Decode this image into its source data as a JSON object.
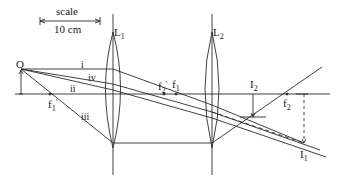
{
  "diagram": {
    "scale": {
      "label": "scale",
      "value": "10 cm"
    },
    "object": {
      "label": "O"
    },
    "lenses": [
      {
        "label": "L",
        "sub": "1"
      },
      {
        "label": "L",
        "sub": "2"
      }
    ],
    "rays": [
      {
        "label": "i"
      },
      {
        "label": "ii"
      },
      {
        "label": "iii"
      },
      {
        "label": "iv"
      }
    ],
    "focal_points": [
      {
        "label": "f",
        "sub": "1",
        "prime": "'"
      },
      {
        "label": "f",
        "sub": "2",
        "prime": "'"
      },
      {
        "label": "f",
        "sub": "1"
      },
      {
        "label": "f",
        "sub": "2"
      }
    ],
    "images": [
      {
        "label": "I",
        "sub": "2"
      },
      {
        "label": "I",
        "sub": "1"
      }
    ],
    "colors": {
      "line": "#2a2a2a",
      "background": "#ffffff"
    }
  }
}
